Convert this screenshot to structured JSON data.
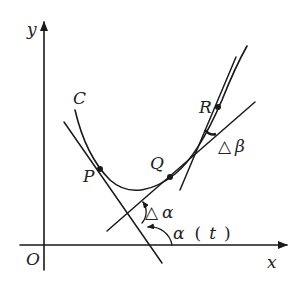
{
  "diagram": {
    "type": "geometry-tangent-angles",
    "colors": {
      "ink": "#1a1a1a",
      "background": "#ffffff"
    },
    "axes": {
      "x_label": "x",
      "y_label": "y",
      "origin_label": "O"
    },
    "curve": {
      "label": "C"
    },
    "points": [
      {
        "id": "P",
        "label": "P"
      },
      {
        "id": "Q",
        "label": "Q"
      },
      {
        "id": "R",
        "label": "R"
      }
    ],
    "angles": {
      "alpha_t": {
        "symbol": "α",
        "paren_open": "(",
        "arg": "t",
        "paren_close": ")"
      },
      "delta_alpha": {
        "delta": "△",
        "symbol": "α"
      },
      "delta_beta": {
        "delta": "△",
        "symbol": "β"
      }
    }
  }
}
